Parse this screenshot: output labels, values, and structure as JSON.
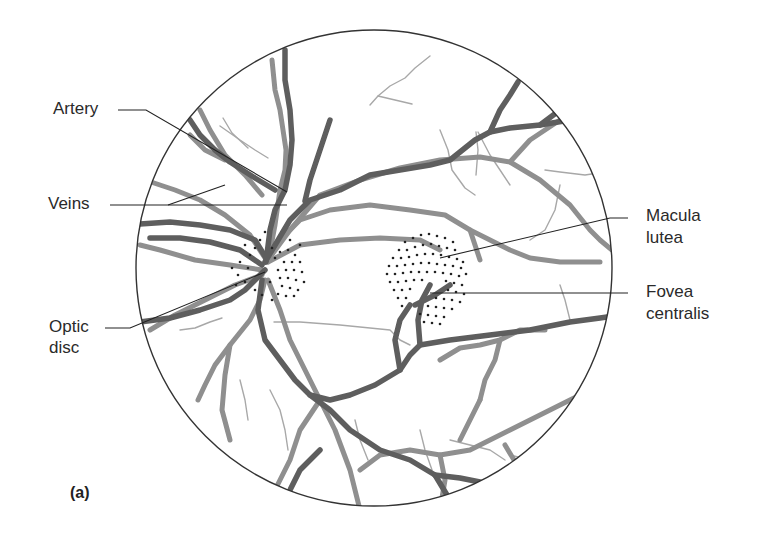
{
  "figure": {
    "panel_label": "(a)",
    "labels": {
      "artery": "Artery",
      "veins": "Veins",
      "optic_disc_line1": "Optic",
      "optic_disc_line2": "disc",
      "macula_line1": "Macula",
      "macula_line2": "lutea",
      "fovea_line1": "Fovea",
      "fovea_line2": "centralis"
    },
    "colors": {
      "background": "#ffffff",
      "outline": "#333333",
      "vein": "#5e5e5e",
      "artery": "#8f8f8f",
      "capillary": "#a8a8a8",
      "dots": "#222222",
      "text": "#2a2a2a"
    },
    "fundus_circle": {
      "cx": 374,
      "cy": 268,
      "r": 238
    }
  }
}
